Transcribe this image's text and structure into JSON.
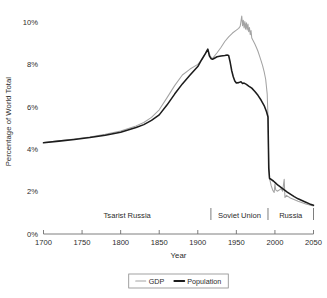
{
  "chart_data": {
    "type": "line",
    "title": "",
    "xlabel": "Year",
    "ylabel": "Percentage of World Total",
    "xlim": [
      1700,
      2050
    ],
    "ylim": [
      0,
      10.6
    ],
    "grid": false,
    "legend_position": "bottom-center",
    "x_ticks": [
      "1700",
      "1750",
      "1800",
      "1850",
      "1900",
      "1950",
      "2000",
      "2050"
    ],
    "x_tick_values": [
      1700,
      1750,
      1800,
      1850,
      1900,
      1950,
      2000,
      2050
    ],
    "y_ticks": [
      "0%",
      "2%",
      "4%",
      "6%",
      "8%",
      "10%"
    ],
    "y_tick_values": [
      0,
      2,
      4,
      6,
      8,
      10
    ],
    "series": [
      {
        "name": "GDP",
        "color": "#a3a3a3",
        "width": 1.05,
        "points": [
          [
            1700,
            4.32
          ],
          [
            1720,
            4.4
          ],
          [
            1740,
            4.48
          ],
          [
            1760,
            4.58
          ],
          [
            1780,
            4.7
          ],
          [
            1800,
            4.86
          ],
          [
            1820,
            5.1
          ],
          [
            1830,
            5.26
          ],
          [
            1840,
            5.5
          ],
          [
            1850,
            5.86
          ],
          [
            1860,
            6.42
          ],
          [
            1870,
            7.0
          ],
          [
            1880,
            7.5
          ],
          [
            1890,
            7.78
          ],
          [
            1900,
            8.0
          ],
          [
            1905,
            8.22
          ],
          [
            1910,
            8.52
          ],
          [
            1913,
            8.7
          ],
          [
            1916,
            8.42
          ],
          [
            1918,
            8.28
          ],
          [
            1920,
            8.32
          ],
          [
            1925,
            8.55
          ],
          [
            1930,
            8.8
          ],
          [
            1935,
            9.08
          ],
          [
            1940,
            9.3
          ],
          [
            1945,
            9.48
          ],
          [
            1950,
            9.62
          ],
          [
            1953,
            9.7
          ],
          [
            1955,
            9.8
          ],
          [
            1957,
            10.28
          ],
          [
            1958,
            9.82
          ],
          [
            1959,
            10.08
          ],
          [
            1960,
            9.72
          ],
          [
            1961,
            10.02
          ],
          [
            1962,
            9.66
          ],
          [
            1963,
            9.96
          ],
          [
            1964,
            9.62
          ],
          [
            1965,
            9.9
          ],
          [
            1966,
            9.54
          ],
          [
            1967,
            9.74
          ],
          [
            1968,
            9.4
          ],
          [
            1969,
            9.6
          ],
          [
            1970,
            9.24
          ],
          [
            1972,
            9.1
          ],
          [
            1974,
            8.96
          ],
          [
            1976,
            8.8
          ],
          [
            1978,
            8.62
          ],
          [
            1980,
            8.4
          ],
          [
            1982,
            8.18
          ],
          [
            1984,
            7.94
          ],
          [
            1986,
            7.66
          ],
          [
            1988,
            7.3
          ],
          [
            1990,
            6.6
          ],
          [
            1991,
            5.52
          ],
          [
            1992,
            3.3
          ],
          [
            1993,
            2.62
          ],
          [
            1995,
            2.3
          ],
          [
            1997,
            2.08
          ],
          [
            1999,
            1.96
          ],
          [
            2000,
            2.36
          ],
          [
            2001,
            2.08
          ],
          [
            2003,
            2.02
          ],
          [
            2005,
            2.06
          ],
          [
            2008,
            2.14
          ],
          [
            2010,
            2.02
          ],
          [
            2012,
            2.58
          ],
          [
            2013,
            1.72
          ],
          [
            2015,
            1.82
          ],
          [
            2020,
            1.7
          ],
          [
            2030,
            1.54
          ],
          [
            2040,
            1.42
          ],
          [
            2050,
            1.32
          ]
        ]
      },
      {
        "name": "Population",
        "color": "#1c1c1c",
        "width": 1.55,
        "points": [
          [
            1700,
            4.3
          ],
          [
            1720,
            4.38
          ],
          [
            1740,
            4.46
          ],
          [
            1760,
            4.55
          ],
          [
            1780,
            4.66
          ],
          [
            1800,
            4.8
          ],
          [
            1820,
            5.02
          ],
          [
            1830,
            5.16
          ],
          [
            1840,
            5.36
          ],
          [
            1850,
            5.62
          ],
          [
            1860,
            6.08
          ],
          [
            1870,
            6.6
          ],
          [
            1880,
            7.08
          ],
          [
            1890,
            7.5
          ],
          [
            1900,
            7.9
          ],
          [
            1905,
            8.22
          ],
          [
            1910,
            8.52
          ],
          [
            1913,
            8.72
          ],
          [
            1915,
            8.4
          ],
          [
            1917,
            8.28
          ],
          [
            1919,
            8.24
          ],
          [
            1921,
            8.28
          ],
          [
            1925,
            8.36
          ],
          [
            1930,
            8.4
          ],
          [
            1935,
            8.42
          ],
          [
            1938,
            8.44
          ],
          [
            1940,
            8.42
          ],
          [
            1942,
            8.1
          ],
          [
            1944,
            7.7
          ],
          [
            1946,
            7.42
          ],
          [
            1948,
            7.22
          ],
          [
            1950,
            7.12
          ],
          [
            1953,
            7.14
          ],
          [
            1956,
            7.18
          ],
          [
            1958,
            7.1
          ],
          [
            1960,
            7.12
          ],
          [
            1963,
            7.06
          ],
          [
            1966,
            6.98
          ],
          [
            1970,
            6.88
          ],
          [
            1974,
            6.72
          ],
          [
            1978,
            6.54
          ],
          [
            1982,
            6.32
          ],
          [
            1986,
            6.06
          ],
          [
            1989,
            5.78
          ],
          [
            1991,
            5.52
          ],
          [
            1992,
            3.1
          ],
          [
            1993,
            2.62
          ],
          [
            1995,
            2.58
          ],
          [
            1998,
            2.5
          ],
          [
            2001,
            2.4
          ],
          [
            2004,
            2.3
          ],
          [
            2007,
            2.22
          ],
          [
            2010,
            2.14
          ],
          [
            2013,
            2.06
          ],
          [
            2016,
            1.98
          ],
          [
            2020,
            1.88
          ],
          [
            2025,
            1.76
          ],
          [
            2030,
            1.66
          ],
          [
            2035,
            1.58
          ],
          [
            2040,
            1.5
          ],
          [
            2045,
            1.42
          ],
          [
            2050,
            1.36
          ]
        ]
      }
    ],
    "eras": [
      {
        "label": "Tsarist Russia",
        "start": 1700,
        "end": 1917
      },
      {
        "label": "Soviet Union",
        "start": 1917,
        "end": 1991
      },
      {
        "label": "Russia",
        "start": 1991,
        "end": 2050
      }
    ],
    "legend": [
      {
        "label": "GDP",
        "color": "#a3a3a3",
        "width": 1.05
      },
      {
        "label": "Population",
        "color": "#1c1c1c",
        "width": 1.8
      }
    ]
  }
}
